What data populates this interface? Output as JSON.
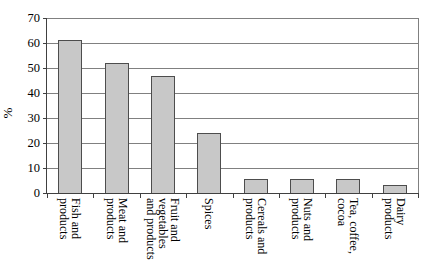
{
  "chart_data": {
    "type": "bar",
    "title": "",
    "xlabel": "",
    "ylabel": "%",
    "ylim": [
      0,
      70
    ],
    "yticks": [
      0,
      10,
      20,
      30,
      40,
      50,
      60,
      70
    ],
    "grid": true,
    "legend": false,
    "categories": [
      {
        "label": "Fish and products",
        "lines": [
          "Fish and",
          "products"
        ]
      },
      {
        "label": "Meat and products",
        "lines": [
          "Meat and",
          "products"
        ]
      },
      {
        "label": "Fruit and vegetables and products",
        "lines": [
          "Fruit and",
          "vegetables",
          "and products"
        ]
      },
      {
        "label": "Spices",
        "lines": [
          "Spices"
        ]
      },
      {
        "label": "Cereals and products",
        "lines": [
          "Cereals and",
          "products"
        ]
      },
      {
        "label": "Nuts and products",
        "lines": [
          "Nuts and",
          "products"
        ]
      },
      {
        "label": "Tea, coffee, cocoa",
        "lines": [
          "Tea, coffee,",
          "cocoa"
        ]
      },
      {
        "label": "Dairy products",
        "lines": [
          "Dairy",
          "products"
        ]
      }
    ],
    "values": [
      61,
      52,
      47,
      24,
      5.5,
      5.5,
      5.5,
      3
    ],
    "colors": {
      "bar_fill": "#c8c8c8",
      "bar_border": "#4d4d4d",
      "gridline": "#808080",
      "axis": "#404040",
      "text": "#000000",
      "background": "#ffffff"
    }
  }
}
